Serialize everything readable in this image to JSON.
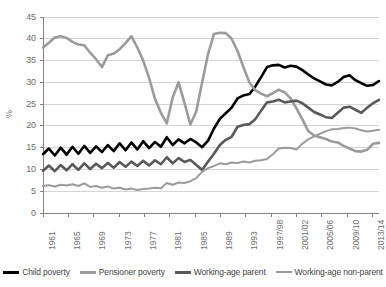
{
  "chart_data": {
    "type": "line",
    "title": "",
    "xlabel": "",
    "ylabel": "%",
    "ylim": [
      0,
      45
    ],
    "ytick_step": 5,
    "yticks": [
      "45",
      "40",
      "35",
      "30",
      "25",
      "20",
      "15",
      "10",
      "5",
      "0"
    ],
    "grid": true,
    "legend_position": "bottom",
    "x_start_year": 1961,
    "x_end_year": 2014,
    "xticks": [
      "1961",
      "1965",
      "1969",
      "1973",
      "1977",
      "1981",
      "1985",
      "1989",
      "1993",
      "1997/98",
      "2001/02",
      "2005/06",
      "2009/10",
      "2013/14"
    ],
    "xtick_years": [
      1961,
      1965,
      1969,
      1973,
      1977,
      1981,
      1985,
      1989,
      1993,
      1997,
      2001,
      2005,
      2009,
      2013
    ],
    "series": [
      {
        "name": "Child poverty",
        "color": "#000000",
        "width": 2.6,
        "values": [
          13.5,
          14.8,
          13.2,
          15.0,
          13.4,
          15.2,
          13.6,
          15.4,
          13.8,
          15.3,
          14.0,
          15.6,
          14.2,
          16.0,
          14.4,
          16.2,
          14.6,
          16.5,
          14.9,
          16.3,
          15.2,
          17.4,
          15.6,
          16.9,
          16.0,
          17.0,
          16.2,
          15.1,
          16.6,
          19.4,
          21.6,
          22.9,
          24.2,
          26.3,
          27.0,
          27.3,
          29.0,
          31.2,
          33.5,
          33.9,
          34.0,
          33.4,
          33.8,
          33.6,
          32.8,
          31.8,
          30.9,
          30.2,
          29.5,
          29.3,
          30.1,
          31.2,
          31.6,
          30.5,
          29.8,
          29.2,
          29.4,
          30.3
        ]
      },
      {
        "name": "Pensioner poverty",
        "color": "#9b9b9b",
        "width": 2.6,
        "values": [
          38.0,
          39.1,
          40.3,
          40.6,
          40.2,
          39.3,
          38.7,
          38.5,
          36.8,
          35.3,
          33.5,
          36.2,
          36.6,
          37.6,
          39.0,
          40.6,
          38.0,
          35.0,
          31.0,
          26.2,
          23.0,
          20.6,
          26.5,
          30.0,
          25.3,
          20.3,
          23.3,
          30.0,
          36.5,
          41.1,
          41.4,
          41.3,
          40.0,
          37.2,
          33.5,
          30.0,
          28.2,
          27.4,
          26.8,
          27.5,
          28.3,
          27.7,
          26.3,
          24.0,
          21.5,
          18.8,
          17.8,
          17.4,
          17.0,
          16.4,
          16.2,
          15.4,
          14.8,
          14.2,
          14.1,
          14.5,
          15.9,
          16.1
        ]
      },
      {
        "name": "Working-age parent",
        "color": "#58595b",
        "width": 2.6,
        "values": [
          9.7,
          10.9,
          9.6,
          11.0,
          9.8,
          11.2,
          9.9,
          11.4,
          10.1,
          11.3,
          10.3,
          11.5,
          10.4,
          11.7,
          10.6,
          11.8,
          10.8,
          12.0,
          10.9,
          12.1,
          11.2,
          12.8,
          11.4,
          12.6,
          11.7,
          12.2,
          11.0,
          9.9,
          11.8,
          13.6,
          15.6,
          16.8,
          17.5,
          19.8,
          20.2,
          20.4,
          21.5,
          23.5,
          25.4,
          25.6,
          26.0,
          25.4,
          25.6,
          25.8,
          25.2,
          24.2,
          23.2,
          22.6,
          22.0,
          21.8,
          23.0,
          24.2,
          24.4,
          23.7,
          23.0,
          24.2,
          25.2,
          26.0
        ]
      },
      {
        "name": "Working-age non-parent",
        "color": "#9b9b9b",
        "width": 2.0,
        "values": [
          6.2,
          6.4,
          6.1,
          6.5,
          6.3,
          6.6,
          6.2,
          6.8,
          6.0,
          6.2,
          5.8,
          6.1,
          5.6,
          5.8,
          5.4,
          5.6,
          5.3,
          5.5,
          5.6,
          5.8,
          5.7,
          6.9,
          6.5,
          7.0,
          6.9,
          7.3,
          8.0,
          9.5,
          10.3,
          10.8,
          11.4,
          11.2,
          11.6,
          11.5,
          11.8,
          11.6,
          12.0,
          12.1,
          12.4,
          13.5,
          14.8,
          15.0,
          14.9,
          14.6,
          15.9,
          16.9,
          17.6,
          18.2,
          18.8,
          19.2,
          19.3,
          19.5,
          19.6,
          19.4,
          19.0,
          18.7,
          18.9,
          19.1
        ]
      }
    ]
  },
  "legend": {
    "items": [
      {
        "label": "Child poverty",
        "color": "#000000"
      },
      {
        "label": "Pensioner poverty",
        "color": "#9b9b9b"
      },
      {
        "label": "Working-age parent",
        "color": "#58595b"
      },
      {
        "label": "Working-age non-parent",
        "color": "#9b9b9b"
      }
    ]
  }
}
